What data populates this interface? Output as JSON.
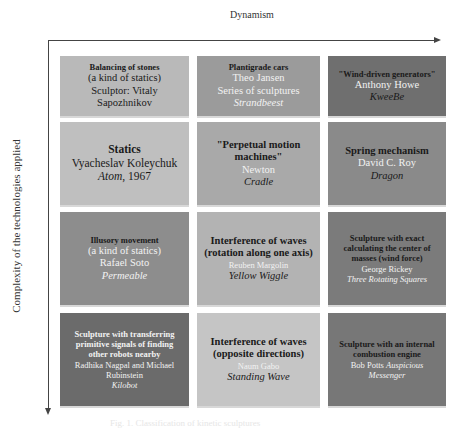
{
  "axes": {
    "x_label": "Dynamism",
    "y_label": "Complexity of the technologies applied"
  },
  "colors": {
    "r1c1": "#b9b9b9",
    "r1c2": "#9b9b9b",
    "r1c3": "#6f6f6f",
    "r2c1": "#bfbfbf",
    "r2c2": "#a9a9a9",
    "r2c3": "#8a8a8a",
    "r3c1": "#8d8d8d",
    "r3c2": "#b3b3b3",
    "r3c3": "#7b7b7b",
    "r4c1": "#6b6b6b",
    "r4c2": "#c5c5c5",
    "r4c3": "#777777"
  },
  "grid": {
    "rows": [
      {
        "cells": [
          {
            "title": "Balancing of stones",
            "subtitle": "(a kind of statics)",
            "artist": "Sculptor: Vitaly Sapozhnikov",
            "work": ""
          },
          {
            "title": "Plantigrade cars",
            "subtitle": "",
            "artist": "Theo Jansen",
            "extra": "Series of sculptures",
            "work": "Strandbeest"
          },
          {
            "title": "\"Wind-driven generators\"",
            "subtitle": "",
            "artist": "Anthony Howe",
            "work": "KweeBe"
          }
        ]
      },
      {
        "cells": [
          {
            "title": "Statics",
            "artist": "Vyacheslav Koleychuk",
            "work": "Atom",
            "year": ", 1967"
          },
          {
            "title": "\"Perpetual motion machines\"",
            "artist": "Newton",
            "work": "Cradle"
          },
          {
            "title": "Spring mechanism",
            "artist": "David C. Roy",
            "work": "Dragon"
          }
        ]
      },
      {
        "cells": [
          {
            "title": "Illusory movement",
            "subtitle": "(a kind of statics)",
            "artist": "Rafael Soto",
            "work": "Permeable"
          },
          {
            "title": "Interference of waves (rotation along one axis)",
            "artist": "Reuben Margolin",
            "work": "Yellow Wiggle"
          },
          {
            "title": "Sculpture with exact calculating the center of masses (wind force)",
            "artist": "George Rickey",
            "work": "Three Rotating Squares"
          }
        ]
      },
      {
        "cells": [
          {
            "title": "Sculpture with transferring primitive signals of finding other robots nearby",
            "artist": "Radhika Nagpal and Michael Rubinstein",
            "work": "Kilobot"
          },
          {
            "title": "Interference of waves (opposite directions)",
            "artist": "Naum Gabo",
            "work": "Standing Wave"
          },
          {
            "title": "Sculpture with an internal combustion engine",
            "artist": "Bob Potts",
            "work": "Auspicious Messenger"
          }
        ]
      }
    ]
  },
  "caption": "Fig. 1. Classification of kinetic sculptures"
}
